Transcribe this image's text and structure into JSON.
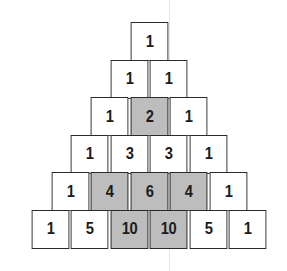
{
  "colors": {
    "cell_bg": "#ffffff",
    "shaded_bg": "#bdbdbd",
    "border": "#2a2a2a",
    "text": "#1c1c1c"
  },
  "rows": [
    {
      "cells": [
        {
          "v": "1",
          "shaded": false
        }
      ]
    },
    {
      "cells": [
        {
          "v": "1",
          "shaded": false
        },
        {
          "v": "1",
          "shaded": false
        }
      ]
    },
    {
      "cells": [
        {
          "v": "1",
          "shaded": false
        },
        {
          "v": "2",
          "shaded": true
        },
        {
          "v": "1",
          "shaded": false
        }
      ]
    },
    {
      "cells": [
        {
          "v": "1",
          "shaded": false
        },
        {
          "v": "3",
          "shaded": false
        },
        {
          "v": "3",
          "shaded": false
        },
        {
          "v": "1",
          "shaded": false
        }
      ]
    },
    {
      "cells": [
        {
          "v": "1",
          "shaded": false
        },
        {
          "v": "4",
          "shaded": true
        },
        {
          "v": "6",
          "shaded": true
        },
        {
          "v": "4",
          "shaded": true
        },
        {
          "v": "1",
          "shaded": false
        }
      ]
    },
    {
      "cells": [
        {
          "v": "1",
          "shaded": false
        },
        {
          "v": "5",
          "shaded": false
        },
        {
          "v": "10",
          "shaded": true
        },
        {
          "v": "10",
          "shaded": true
        },
        {
          "v": "5",
          "shaded": false
        },
        {
          "v": "1",
          "shaded": false
        }
      ]
    }
  ]
}
